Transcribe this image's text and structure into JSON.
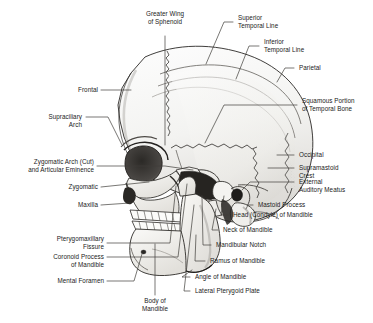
{
  "figure": {
    "type": "anatomical-illustration",
    "background_color": "#ffffff",
    "ink_color": "#1a1a1a",
    "leader_line_color": "#4a4a4a"
  },
  "labels": {
    "greater_wing_of_sphenoid": "Greater Wing\nof Sphenoid",
    "superior_temporal_line": "Superior\nTemporal Line",
    "inferior_temporal_line": "Inferior\nTemporal Line",
    "parietal": "Parietal",
    "squamous_portion_of_temporal_bone": "Squamous Portion\nof Temporal Bone",
    "frontal": "Frontal",
    "supraciliary_arch": "Supraciliary\nArch",
    "occipital": "Occipital",
    "supramastoid_crest": "Supramastoid\nCrest",
    "zygomatic_arch_cut": "Zygomatic Arch (Cut)\nand Articular Eminence",
    "external_auditory_meatus": "External\nAuditory Meatus",
    "zygomatic": "Zygomatic",
    "mastoid_process": "Mastoid Process",
    "maxilla": "Maxilla",
    "head_condyle_of_mandible": "Head (Condyle) of Mandible",
    "neck_of_mandible": "Neck of Mandible",
    "pterygomaxillary_fissure": "Pterygomaxillary\nFissure",
    "mandibular_notch": "Mandibular Notch",
    "coronoid_process_of_mandible": "Coronoid Process\nof Mandible",
    "ramus_of_mandible": "Ramus of Mandible",
    "mental_foramen": "Mental Foramen",
    "angle_of_mandible": "Angle of Mandible",
    "lateral_pterygoid_plate": "Lateral Pterygoid Plate",
    "body_of_mandible": "Body of\nMandible"
  }
}
